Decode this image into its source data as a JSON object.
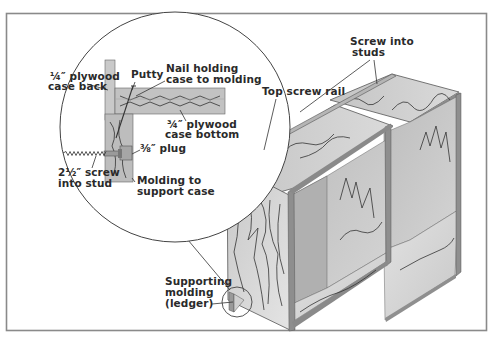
{
  "diagram": {
    "type": "woodworking-illustration",
    "colors": {
      "frame": "#8a8a8a",
      "plywood_light": "#d9d9d9",
      "plywood_mid": "#bdbdbd",
      "plywood_dark": "#9a9a9a",
      "grain": "#7d7d7d",
      "text": "#2a2a2a"
    },
    "labels": {
      "case_back_1": "¼″ plywood",
      "case_back_2": "case back",
      "putty": "Putty",
      "nail_1": "Nail holding",
      "nail_2": "case to molding",
      "case_bottom_1": "¾″ plywood",
      "case_bottom_2": "case bottom",
      "plug": "⅜″ plug",
      "screw_1": "2½″ screw",
      "screw_2": "into stud",
      "molding_1": "Molding to",
      "molding_2": "support case",
      "top_rail": "Top screw rail",
      "screw_studs_1": "Screw into",
      "screw_studs_2": "studs",
      "ledger_1": "Supporting",
      "ledger_2": "molding",
      "ledger_3": "(ledger)"
    }
  }
}
